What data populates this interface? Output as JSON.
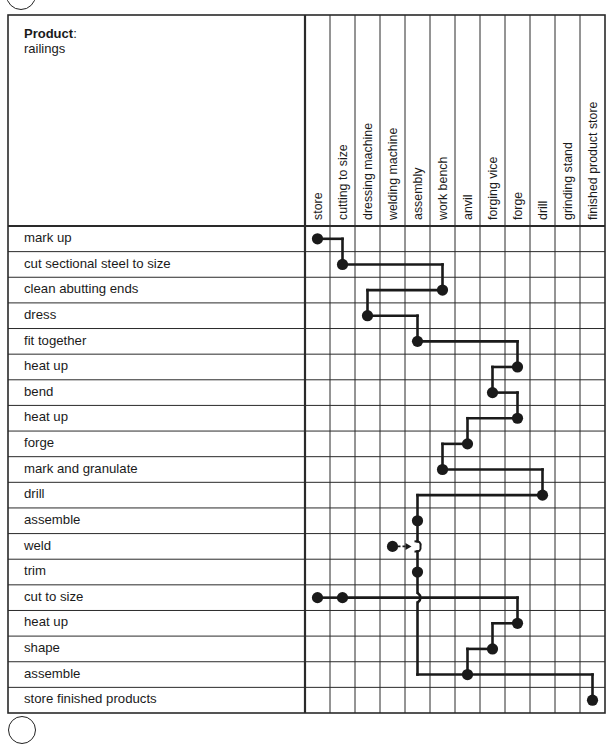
{
  "header": {
    "product_heading": "Product",
    "product_colon": ":",
    "product_name": "railings"
  },
  "columns": [
    {
      "id": "store",
      "label": "store"
    },
    {
      "id": "cutting_to_size",
      "label": "cutting to size"
    },
    {
      "id": "dressing_machine",
      "label": "dressing machine"
    },
    {
      "id": "welding_machine",
      "label": "welding machine"
    },
    {
      "id": "assembly",
      "label": "assembly"
    },
    {
      "id": "work_bench",
      "label": "work bench"
    },
    {
      "id": "anvil",
      "label": "anvil"
    },
    {
      "id": "forging_vice",
      "label": "forging vice"
    },
    {
      "id": "forge",
      "label": "forge"
    },
    {
      "id": "drill",
      "label": "drill"
    },
    {
      "id": "grinding_stand",
      "label": "grinding stand"
    },
    {
      "id": "finished_product_store",
      "label": "finished product store"
    }
  ],
  "steps": [
    {
      "label": "mark up",
      "stations": [
        0
      ]
    },
    {
      "label": "cut sectional steel to size",
      "stations": [
        1
      ]
    },
    {
      "label": "clean abutting ends",
      "stations": [
        5
      ]
    },
    {
      "label": "dress",
      "stations": [
        2
      ]
    },
    {
      "label": "fit together",
      "stations": [
        4
      ]
    },
    {
      "label": "heat up",
      "stations": [
        8
      ]
    },
    {
      "label": "bend",
      "stations": [
        7
      ]
    },
    {
      "label": "heat up",
      "stations": [
        8
      ]
    },
    {
      "label": "forge",
      "stations": [
        6
      ]
    },
    {
      "label": "mark and granulate",
      "stations": [
        5
      ]
    },
    {
      "label": "drill",
      "stations": [
        9
      ]
    },
    {
      "label": "assemble",
      "stations": [
        4
      ]
    },
    {
      "label": "weld",
      "stations": [
        3
      ],
      "feeds_into_column": 4,
      "dashed_arrow": true
    },
    {
      "label": "trim",
      "stations": [
        4
      ]
    },
    {
      "label": "cut to size",
      "stations": [
        0,
        1
      ]
    },
    {
      "label": "heat up",
      "stations": [
        8
      ]
    },
    {
      "label": "shape",
      "stations": [
        7
      ]
    },
    {
      "label": "assemble",
      "stations": [
        6
      ]
    },
    {
      "label": "store finished products",
      "stations": [
        11
      ]
    }
  ],
  "flow_paths": [
    {
      "name": "main-line",
      "sequence": [
        [
          0,
          0
        ],
        [
          1,
          1
        ],
        [
          2,
          5
        ],
        [
          3,
          2
        ],
        [
          4,
          4
        ],
        [
          5,
          8
        ],
        [
          6,
          7
        ],
        [
          7,
          8
        ],
        [
          8,
          6
        ],
        [
          9,
          5
        ],
        [
          10,
          9
        ],
        [
          11,
          4
        ],
        [
          12,
          4
        ],
        [
          13,
          4
        ],
        [
          17,
          6
        ],
        [
          18,
          11
        ]
      ]
    },
    {
      "name": "sub-assembly-line",
      "sequence": [
        [
          14,
          1
        ],
        [
          15,
          8
        ],
        [
          16,
          7
        ],
        [
          17,
          6
        ]
      ]
    }
  ],
  "colors": {
    "line": "#1a1a1a",
    "grid": "#2a2a2a",
    "background": "#ffffff"
  }
}
